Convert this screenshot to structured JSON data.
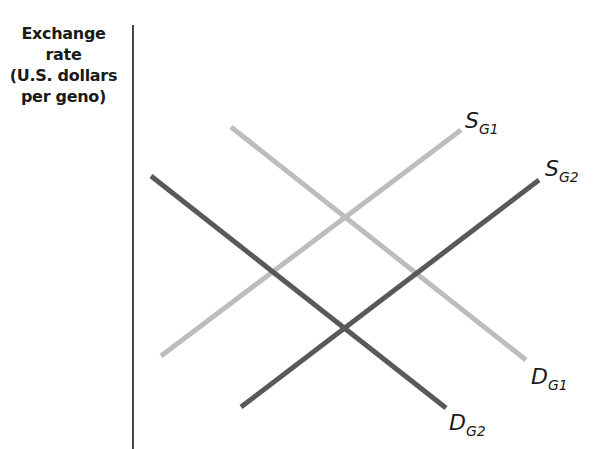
{
  "diagram": {
    "type": "supply-demand",
    "y_axis": {
      "label_lines": [
        "Exchange",
        "rate",
        "(U.S. dollars",
        "per geno)"
      ]
    },
    "colors": {
      "axis": "#1a1a1a",
      "original_curves": "#bdbdbd",
      "shifted_curves": "#595959"
    },
    "curves": [
      {
        "id": "S_G1",
        "main": "S",
        "sub": "G1",
        "kind": "supply",
        "shade": "light",
        "from": [
          161,
          356
        ],
        "to": [
          461,
          130
        ]
      },
      {
        "id": "D_G1",
        "main": "D",
        "sub": "G1",
        "kind": "demand",
        "shade": "light",
        "from": [
          231,
          127
        ],
        "to": [
          526,
          360
        ]
      },
      {
        "id": "S_G2",
        "main": "S",
        "sub": "G2",
        "kind": "supply",
        "shade": "dark",
        "from": [
          241,
          407
        ],
        "to": [
          539,
          180
        ]
      },
      {
        "id": "D_G2",
        "main": "D",
        "sub": "G2",
        "kind": "demand",
        "shade": "dark",
        "from": [
          151,
          176
        ],
        "to": [
          446,
          408
        ]
      }
    ],
    "labels": {
      "S_G1": {
        "main": "S",
        "sub": "G1"
      },
      "S_G2": {
        "main": "S",
        "sub": "G2"
      },
      "D_G1": {
        "main": "D",
        "sub": "G1"
      },
      "D_G2": {
        "main": "D",
        "sub": "G2"
      }
    }
  }
}
